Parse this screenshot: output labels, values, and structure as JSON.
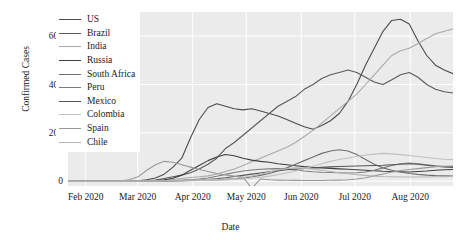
{
  "chart_data": {
    "type": "line",
    "title": "",
    "xlabel": "Date",
    "ylabel": "Confirmed Cases",
    "grid": true,
    "legend_position": "upper-left",
    "xlim": [
      "2020-01-22",
      "2020-08-25"
    ],
    "ylim": [
      -2000,
      70000
    ],
    "yticks": [
      0,
      20000,
      40000,
      60000
    ],
    "ytick_labels": [
      "0",
      "20k",
      "40k",
      "60k"
    ],
    "xticks": [
      "2020-02-01",
      "2020-03-01",
      "2020-04-01",
      "2020-05-01",
      "2020-06-01",
      "2020-07-01",
      "2020-08-01"
    ],
    "xtick_labels": [
      "Feb 2020",
      "Mar 2020",
      "Apr 2020",
      "May 2020",
      "Jun 2020",
      "Jul 2020",
      "Aug 2020"
    ],
    "series": [
      {
        "name": "US",
        "color": "#4c4c4c",
        "values": [
          0,
          0,
          0,
          0,
          0,
          0,
          30,
          80,
          200,
          600,
          1300,
          2900,
          5800,
          9500,
          18000,
          25500,
          30500,
          32000,
          31000,
          30000,
          29500,
          30000,
          29000,
          28000,
          27000,
          25500,
          24000,
          22500,
          21500,
          23000,
          25000,
          28000,
          33000,
          40000,
          48000,
          55000,
          62000,
          66500,
          67000,
          65000,
          58000,
          52000,
          48000,
          46000,
          44500
        ]
      },
      {
        "name": "Brazil",
        "color": "#5a5a5a",
        "values": [
          0,
          0,
          0,
          0,
          0,
          0,
          0,
          10,
          40,
          150,
          500,
          1100,
          1800,
          2500,
          3500,
          5000,
          7000,
          9500,
          13500,
          16000,
          19000,
          22000,
          25000,
          28000,
          31000,
          33000,
          35000,
          38000,
          40000,
          42500,
          44000,
          45000,
          46000,
          45000,
          43000,
          41000,
          40000,
          42000,
          44000,
          45000,
          43000,
          40000,
          38000,
          37000,
          36500
        ]
      },
      {
        "name": "India",
        "color": "#a9a9a9",
        "values": [
          0,
          0,
          0,
          0,
          0,
          0,
          0,
          0,
          10,
          40,
          120,
          350,
          700,
          1100,
          1500,
          1800,
          2200,
          3000,
          4000,
          5000,
          6500,
          8000,
          9500,
          11000,
          12500,
          14000,
          16000,
          18500,
          21000,
          24000,
          27000,
          30000,
          33000,
          36000,
          40000,
          44000,
          48000,
          52000,
          54000,
          55000,
          57000,
          59000,
          61000,
          62000,
          63000
        ]
      },
      {
        "name": "Russia",
        "color": "#3f3f3f",
        "values": [
          0,
          0,
          0,
          0,
          0,
          0,
          0,
          10,
          30,
          100,
          250,
          600,
          1200,
          2500,
          4500,
          6500,
          8500,
          10000,
          11000,
          10500,
          9500,
          8700,
          8200,
          7800,
          7200,
          6800,
          6400,
          6000,
          5700,
          5500,
          5300,
          5100,
          4900,
          4700,
          4500,
          4300,
          4100,
          4000,
          3900,
          3800,
          4000,
          4200,
          4500,
          4700,
          4800
        ]
      },
      {
        "name": "South Africa",
        "color": "#6f6f6f",
        "values": [
          0,
          0,
          0,
          0,
          0,
          0,
          0,
          0,
          5,
          20,
          60,
          100,
          150,
          200,
          260,
          320,
          400,
          500,
          700,
          950,
          1300,
          1800,
          2400,
          3200,
          4200,
          5500,
          7000,
          8500,
          10000,
          11500,
          12500,
          13000,
          12500,
          11000,
          9000,
          7000,
          5500,
          4500,
          3800,
          3200,
          2800,
          2500,
          2300,
          2200,
          2100
        ]
      },
      {
        "name": "Peru",
        "color": "#7d7d7d",
        "values": [
          0,
          0,
          0,
          0,
          0,
          0,
          0,
          0,
          5,
          30,
          90,
          180,
          280,
          400,
          600,
          900,
          1300,
          2000,
          2800,
          3600,
          4200,
          4600,
          4900,
          5100,
          5200,
          5000,
          4600,
          4200,
          3900,
          3700,
          3600,
          3500,
          3400,
          3500,
          3800,
          4500,
          5500,
          6500,
          7200,
          7500,
          7200,
          6800,
          6400,
          6100,
          6000
        ]
      },
      {
        "name": "Mexico",
        "color": "#555555",
        "values": [
          0,
          0,
          0,
          0,
          0,
          0,
          0,
          0,
          0,
          5,
          20,
          60,
          120,
          220,
          350,
          500,
          700,
          1000,
          1400,
          1900,
          2400,
          2900,
          3400,
          3900,
          4300,
          4700,
          5000,
          5300,
          5500,
          5700,
          5900,
          6100,
          6200,
          6300,
          6400,
          6500,
          6600,
          6800,
          7000,
          7200,
          7000,
          6600,
          6200,
          5900,
          5700
        ]
      },
      {
        "name": "Colombia",
        "color": "#c0c0c0",
        "values": [
          0,
          0,
          0,
          0,
          0,
          0,
          0,
          0,
          0,
          5,
          15,
          50,
          90,
          140,
          200,
          260,
          330,
          420,
          550,
          700,
          900,
          1200,
          1600,
          2100,
          2700,
          3400,
          4200,
          5200,
          6200,
          7200,
          8200,
          9000,
          9600,
          10200,
          10800,
          11200,
          11500,
          11300,
          11000,
          10600,
          10200,
          9800,
          9400,
          9100,
          8900
        ]
      },
      {
        "name": "Spain",
        "color": "#999999",
        "values": [
          0,
          0,
          0,
          0,
          0,
          20,
          120,
          600,
          1800,
          4500,
          6800,
          8200,
          7800,
          6800,
          5800,
          4800,
          4000,
          3200,
          2600,
          2100,
          1700,
          -3000,
          900,
          600,
          450,
          380,
          330,
          300,
          280,
          300,
          350,
          450,
          600,
          900,
          1400,
          2200,
          3000,
          3800,
          4400,
          4800,
          5200,
          5600,
          6000,
          6200,
          6300
        ]
      },
      {
        "name": "Chile",
        "color": "#b5b5b5",
        "values": [
          0,
          0,
          0,
          0,
          0,
          0,
          0,
          0,
          10,
          50,
          120,
          200,
          300,
          400,
          480,
          550,
          620,
          700,
          850,
          1100,
          1500,
          2100,
          2900,
          3800,
          4600,
          5200,
          5500,
          5400,
          5000,
          4500,
          4000,
          3500,
          3100,
          2700,
          2400,
          2100,
          1900,
          1800,
          1750,
          1700,
          1700,
          1750,
          1800,
          1850,
          1900
        ]
      }
    ]
  }
}
